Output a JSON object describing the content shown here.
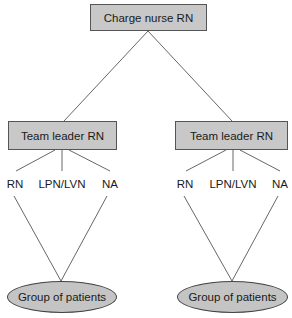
{
  "diagram": {
    "type": "org-chart",
    "root": {
      "label": "Charge nurse RN"
    },
    "teams": [
      {
        "leader": "Team leader RN",
        "members": [
          "RN",
          "LPN/LVN",
          "NA"
        ],
        "patients": "Group of patients"
      },
      {
        "leader": "Team leader RN",
        "members": [
          "RN",
          "LPN/LVN",
          "NA"
        ],
        "patients": "Group of patients"
      }
    ],
    "colors": {
      "node_fill": "#c8c8c8",
      "node_border": "#555555",
      "line": "#555555"
    }
  }
}
